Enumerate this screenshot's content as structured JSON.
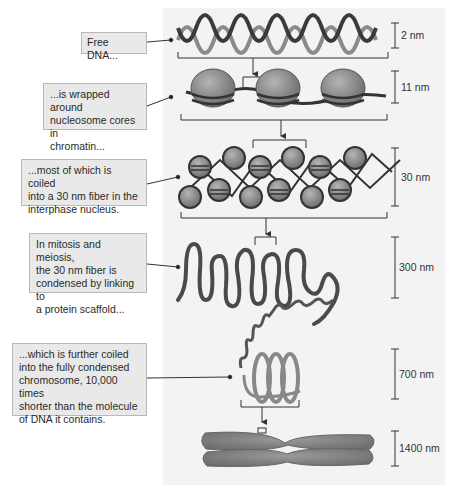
{
  "callouts": [
    {
      "id": "free-dna",
      "lines": [
        "Free DNA..."
      ]
    },
    {
      "id": "nucleosome",
      "lines": [
        "...is wrapped around",
        "nucleosome cores in",
        "chromatin..."
      ]
    },
    {
      "id": "fiber-30nm",
      "lines": [
        "...most of which is coiled",
        "into a 30 nm fiber in the",
        "interphase nucleus."
      ]
    },
    {
      "id": "scaffold",
      "lines": [
        "In mitosis and meiosis,",
        "the 30 nm fiber is",
        "condensed by linking to",
        "a protein scaffold..."
      ]
    },
    {
      "id": "chromosome",
      "lines": [
        "...which is further coiled",
        "into the fully condensed",
        "chromosome, 10,000 times",
        "shorter than the molecule",
        "of DNA it contains."
      ]
    }
  ],
  "scales": [
    {
      "label": "2 nm"
    },
    {
      "label": "11 nm"
    },
    {
      "label": "30 nm"
    },
    {
      "label": "300 nm"
    },
    {
      "label": "700 nm"
    },
    {
      "label": "1400 nm"
    }
  ],
  "colors": {
    "dna_dark": "#3a3a3a",
    "dna_light": "#8a8a8a",
    "nucleosome": "#8c8c8c",
    "panel": "#f3f3f3",
    "callout_bg": "#e9e9e9"
  }
}
